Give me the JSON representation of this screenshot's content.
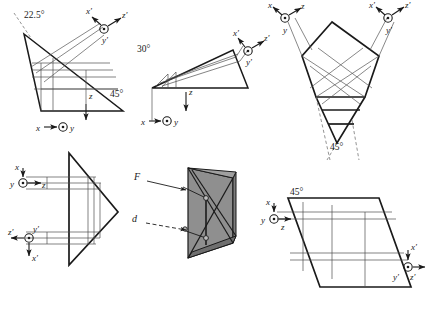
{
  "figure": {
    "name": "prism-ray-diagrams",
    "background_color": "#ffffff",
    "line_color": "#1a1a1a",
    "ray_color": "#555555",
    "dashed_color": "#777777",
    "shade_color": "#8c8c8c",
    "panels": [
      {
        "id": "panel-top-left",
        "name": "wedge-prism-22p5",
        "angles": [
          "22.5°",
          "45°"
        ],
        "axes": [
          {
            "group": "unprimed",
            "labels": [
              "x",
              "y",
              "z"
            ]
          },
          {
            "group": "primed",
            "labels": [
              "x′",
              "y′",
              "z′"
            ]
          }
        ]
      },
      {
        "id": "panel-top-center",
        "name": "wedge-prism-30",
        "angles": [
          "30°"
        ],
        "axes": [
          {
            "group": "unprimed",
            "labels": [
              "x",
              "y",
              "z"
            ]
          },
          {
            "group": "primed",
            "labels": [
              "x′",
              "y′",
              "z′"
            ]
          }
        ]
      },
      {
        "id": "panel-top-right",
        "name": "pentaprism-45",
        "angles": [
          "45°"
        ],
        "axes": [
          {
            "group": "unprimed",
            "labels": [
              "x",
              "y",
              "z"
            ]
          },
          {
            "group": "primed",
            "labels": [
              "x′",
              "y′",
              "z′"
            ]
          }
        ]
      },
      {
        "id": "panel-bottom-left",
        "name": "corner-reflector-prism",
        "angles": [],
        "axes": [
          {
            "group": "unprimed",
            "labels": [
              "x",
              "y",
              "z"
            ]
          },
          {
            "group": "primed",
            "labels": [
              "x′",
              "y′",
              "z′"
            ]
          }
        ]
      },
      {
        "id": "panel-bottom-center",
        "name": "shaded-roof-prism-3d",
        "angles": [],
        "ray_labels": [
          "F",
          "d"
        ],
        "axes": []
      },
      {
        "id": "panel-bottom-right",
        "name": "parallelogram-prism-45",
        "angles": [
          "45°"
        ],
        "axes": [
          {
            "group": "unprimed",
            "labels": [
              "x",
              "y",
              "z"
            ]
          },
          {
            "group": "primed",
            "labels": [
              "x′",
              "y′",
              "z′"
            ]
          }
        ]
      }
    ],
    "labels": {
      "a1_225": "22.5°",
      "a1_45": "45°",
      "a2_30": "30°",
      "a3_45": "45°",
      "a6_45": "45°",
      "x": "x",
      "y": "y",
      "z": "z",
      "xp": "x′",
      "yp": "y′",
      "zp": "z′",
      "F": "F",
      "d": "d"
    }
  }
}
